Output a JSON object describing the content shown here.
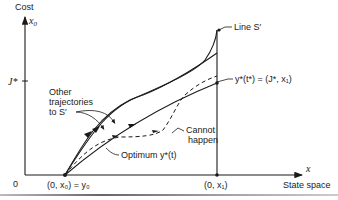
{
  "figure": {
    "y_axis": {
      "label": "Cost",
      "symbol": "x",
      "subscript": "0"
    },
    "x_axis": {
      "label": "State space",
      "symbol": "x"
    },
    "origin_label": "0",
    "j_star_label": "J*",
    "start_point_label": "(0, x₀) = y₀",
    "end_point_label": "(0, x₁)",
    "line_s_label": "Line S′",
    "terminal_label": "y*(t*) = (J*, x₁)",
    "other_trajectories_label": [
      "Other",
      "trajectories",
      "to S′"
    ],
    "cannot_happen_label": [
      "Cannot",
      "happen"
    ],
    "optimum_label": "Optimum  y*(t)"
  },
  "colors": {
    "ink": "#1a1a1a",
    "background": "#ffffff"
  }
}
